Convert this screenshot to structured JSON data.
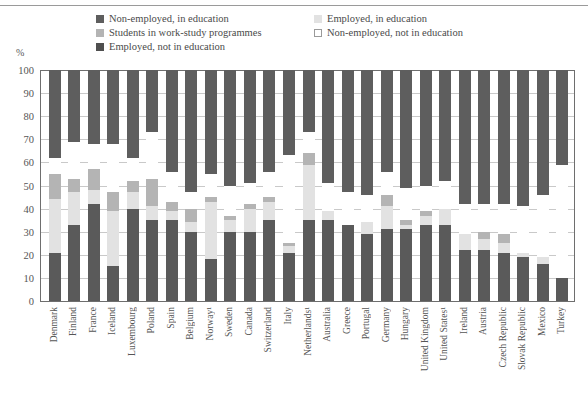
{
  "axis": {
    "unit_label": "%",
    "y_ticks": [
      0,
      10,
      20,
      30,
      40,
      50,
      60,
      70,
      80,
      90,
      100
    ]
  },
  "legend": {
    "items": [
      {
        "label": "Non-employed, in education",
        "color": "#5e5e5e",
        "swatch": "legend-swatch-non-employed-in-education"
      },
      {
        "label": "Employed, in education",
        "color": "#e2e2e2",
        "swatch": "legend-swatch-employed-in-education"
      },
      {
        "label": "Students in work-study programmes",
        "color": "#b4b4b4",
        "swatch": "legend-swatch-work-study"
      },
      {
        "label": "Non-employed, not in education",
        "color": "#ffffff",
        "swatch": "legend-swatch-non-employed-not-in-education"
      },
      {
        "label": "Employed, not in education",
        "color": "#5a5a5a",
        "swatch": "legend-swatch-employed-not-in-education"
      }
    ]
  },
  "chart_data": {
    "type": "bar",
    "title": "",
    "xlabel": "",
    "ylabel": "%",
    "ylim": [
      0,
      100
    ],
    "grid": true,
    "stacked": true,
    "legend_position": "top",
    "categories": [
      "Denmark",
      "Finland",
      "France",
      "Iceland",
      "Luxembourg",
      "Poland",
      "Spain",
      "Belgium",
      "Norway¹",
      "Sweden",
      "Canada",
      "Switzerland",
      "Italy",
      "Netherlands¹",
      "Australia",
      "Greece",
      "Portugal",
      "Germany",
      "Hungary",
      "United Kingdom",
      "United States¹",
      "Ireland",
      "Austria",
      "Czech Republic",
      "Slovak Republic",
      "Mexico",
      "Turkey"
    ],
    "series": [
      {
        "name": "Employed, not in education",
        "color": "#5a5a5a",
        "values": [
          21,
          33,
          42,
          15,
          40,
          35,
          35,
          30,
          18,
          30,
          30,
          35,
          21,
          35,
          35,
          33,
          29,
          31,
          31,
          33,
          33,
          22,
          22,
          21,
          19,
          16,
          10
        ]
      },
      {
        "name": "Employed, in education",
        "color": "#e2e2e2",
        "values": [
          23,
          14,
          6,
          24,
          7,
          6,
          4,
          4,
          25,
          5,
          10,
          8,
          3,
          24,
          4,
          0,
          5,
          10,
          2,
          4,
          7,
          7,
          5,
          4,
          2,
          3,
          0
        ]
      },
      {
        "name": "Students in work-study programmes",
        "color": "#b4b4b4",
        "values": [
          11,
          6,
          9,
          8,
          5,
          12,
          4,
          6,
          2,
          2,
          2,
          2,
          1,
          5,
          0,
          0,
          0,
          5,
          2,
          2,
          0,
          0,
          3,
          4,
          0,
          0,
          0
        ]
      },
      {
        "name": "Non-employed, not in education",
        "color": "#ffffff",
        "values": [
          7,
          16,
          11,
          21,
          10,
          20,
          13,
          7,
          10,
          13,
          9,
          11,
          38,
          9,
          12,
          14,
          12,
          10,
          14,
          11,
          12,
          13,
          12,
          13,
          20,
          27,
          49
        ]
      },
      {
        "name": "Non-employed, in education",
        "color": "#5e5e5e",
        "values": [
          38,
          31,
          32,
          32,
          38,
          27,
          44,
          53,
          45,
          50,
          49,
          44,
          37,
          27,
          49,
          53,
          54,
          44,
          51,
          50,
          48,
          58,
          58,
          58,
          59,
          54,
          41
        ]
      }
    ]
  }
}
